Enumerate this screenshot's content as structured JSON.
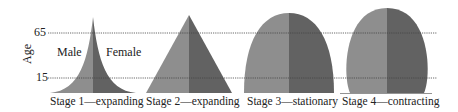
{
  "axis": {
    "title": "Age",
    "ticks": [
      "65",
      "15"
    ]
  },
  "legend": {
    "male": "Male",
    "female": "Female"
  },
  "stages": [
    {
      "label": "Stage 1—expanding",
      "shape": "concave-pyramid"
    },
    {
      "label": "Stage 2—expanding",
      "shape": "triangle"
    },
    {
      "label": "Stage 3—stationary",
      "shape": "dome"
    },
    {
      "label": "Stage 4—contracting",
      "shape": "egg"
    }
  ],
  "colors": {
    "male": "#8e8e8e",
    "female": "#626262",
    "gridline": "#555555",
    "text": "#222222"
  }
}
